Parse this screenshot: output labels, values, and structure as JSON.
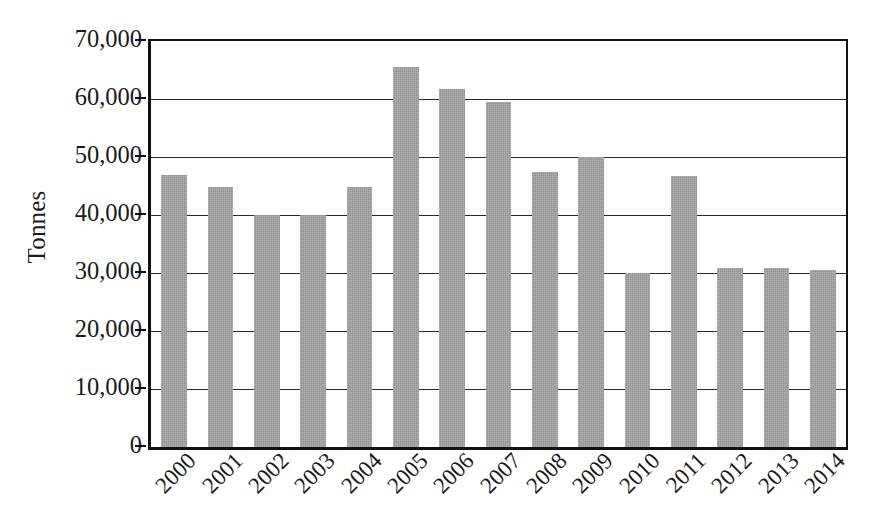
{
  "chart_data": {
    "type": "bar",
    "title": "",
    "subtitle": "",
    "xlabel": "",
    "ylabel": "Tonnes",
    "ylim": [
      0,
      70000
    ],
    "ytick_values": [
      0,
      10000,
      20000,
      30000,
      40000,
      50000,
      60000,
      70000
    ],
    "ytick_labels": [
      "0",
      "10,000",
      "20,000",
      "30,000",
      "40,000",
      "50,000",
      "60,000",
      "70,000"
    ],
    "grid": true,
    "legend": false,
    "legend_position": "none",
    "bar_color": "#a2a2a2",
    "axis_color": "#111111",
    "categories": [
      "2000",
      "2001",
      "2002",
      "2003",
      "2004",
      "2005",
      "2006",
      "2007",
      "2008",
      "2009",
      "2010",
      "2011",
      "2012",
      "2013",
      "2014"
    ],
    "values": [
      46900,
      44900,
      40000,
      40000,
      44900,
      65500,
      61700,
      59400,
      47400,
      50000,
      30000,
      46800,
      30800,
      30900,
      30600
    ],
    "xtick_rotation": -45
  }
}
